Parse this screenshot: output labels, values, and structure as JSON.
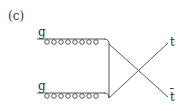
{
  "panel_label": "(c)",
  "particles": {
    "gluon_top": "g",
    "gluon_bottom": "g",
    "top_quark": "t",
    "antitop_quark": "t̄"
  }
}
